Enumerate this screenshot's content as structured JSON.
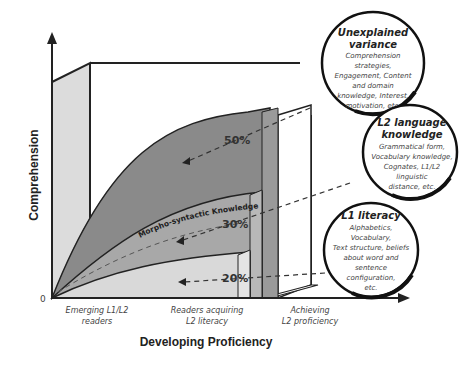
{
  "axes": {
    "y_title": "Comprehension",
    "x_title": "Developing Proficiency",
    "origin_label": "0"
  },
  "x_categories": [
    {
      "line1": "Emerging L1/L2",
      "line2": "readers"
    },
    {
      "line1": "Readers acquiring",
      "line2": "L2 literacy"
    },
    {
      "line1": "Achieving",
      "line2": "L2 proficiency"
    }
  ],
  "layers": [
    {
      "name": "L1 literacy",
      "percent": "20%",
      "color": "#dadada"
    },
    {
      "name": "L2 language knowledge",
      "percent": "30%",
      "color": "#a8a8a8",
      "band_label": "Morpho-syntactic Knowledge"
    },
    {
      "name": "Unexplained variance",
      "percent": "50%",
      "color": "#8a8a8a"
    }
  ],
  "bubbles": [
    {
      "title_line1": "Unexplained",
      "title_line2": "variance",
      "lines": [
        "Comprehension",
        "strategies,",
        "Engagement, Content",
        "and domain",
        "knowledge, Interest,",
        "motivation, etc."
      ]
    },
    {
      "title_line1": "L2 language",
      "title_line2": "knowledge",
      "lines": [
        "Grammatical form,",
        "Vocabulary knowledge,",
        "Cognates, L1/L2",
        "linguistic",
        "distance, etc."
      ]
    },
    {
      "title_line1": "L1 literacy",
      "title_line2": "",
      "lines": [
        "Alphabetics,",
        "Vocabulary,",
        "Text structure, beliefs",
        "about word and",
        "sentence",
        "configuration,",
        "etc."
      ]
    }
  ],
  "colors": {
    "wall": "#dcdcdc",
    "outline": "#222222",
    "unexplained": "#8a8a8a",
    "l2": "#a6a6a6",
    "l1": "#d9d9d9"
  }
}
